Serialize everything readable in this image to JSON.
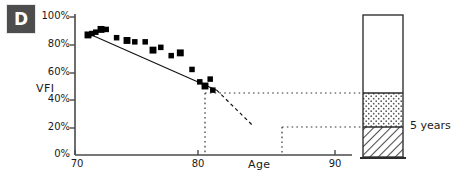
{
  "panel": {
    "label": "D"
  },
  "axes": {
    "y_title": "VFI",
    "x_title": "Age",
    "y_ticks": [
      "0%",
      "20%",
      "40%",
      "60%",
      "80%",
      "100%"
    ],
    "x_ticks": [
      "70",
      "80",
      "90"
    ]
  },
  "annotation": {
    "bar_label": "5 years"
  },
  "colors": {
    "panel_tag_bg": "#4d4d4d",
    "panel_tag_text": "#ffffff",
    "axis": "#4a4a4a",
    "point": "#000000",
    "trend": "#000000",
    "dotted": "#333333",
    "bar_outline": "#333333",
    "bar_top_fill": "#ffffff",
    "bar_mid_fill": "#f2f2f2",
    "bar_bottom_fill": "#e0e0e0"
  },
  "chart_data": {
    "type": "scatter",
    "title": "",
    "xlabel": "Age",
    "ylabel": "VFI",
    "xlim": [
      70,
      90
    ],
    "ylim": [
      0,
      100
    ],
    "grid": false,
    "legend": null,
    "series": [
      {
        "name": "VFI measurements",
        "marker": "filled-square",
        "x": [
          71.0,
          71.3,
          71.6,
          72.0,
          72.4,
          73.2,
          74.0,
          74.6,
          75.4,
          76.0,
          76.6,
          77.4,
          78.1,
          79.0,
          79.6,
          80.0,
          80.4,
          80.6
        ],
        "y": [
          87,
          88,
          89,
          91,
          91,
          85,
          83,
          82,
          82,
          76,
          78,
          72,
          74,
          62,
          53,
          50,
          55,
          47
        ]
      }
    ],
    "trend_line": {
      "name": "regression fit",
      "style": "solid",
      "x": [
        70.8,
        80.9
      ],
      "y": [
        89,
        47
      ]
    },
    "extrapolation_line": {
      "name": "5-year projection",
      "style": "dashed",
      "x": [
        80.9,
        83.6
      ],
      "y": [
        47,
        22
      ]
    },
    "reference_lines": [
      {
        "name": "current-vfi",
        "orientation": "horizontal",
        "y": 47,
        "x_from": 80.9,
        "x_to": 90.0,
        "style": "dotted"
      },
      {
        "name": "projected-vfi",
        "orientation": "horizontal",
        "y": 22,
        "x_from": 83.6,
        "x_to": 90.0,
        "style": "dotted"
      },
      {
        "name": "current-age",
        "orientation": "vertical",
        "x": 80.9,
        "y_from": 0,
        "y_to": 47,
        "style": "dotted"
      },
      {
        "name": "projected-age",
        "orientation": "vertical",
        "x": 83.6,
        "y_from": 0,
        "y_to": 22,
        "style": "dotted"
      }
    ],
    "reserve_bar": {
      "name": "visual-field-reserve-bar",
      "segments": [
        {
          "name": "remaining-reserve",
          "from": 47,
          "to": 100,
          "fill": "blank"
        },
        {
          "name": "five-year-loss",
          "from": 22,
          "to": 47,
          "fill": "stipple"
        },
        {
          "name": "residual-after-5-years",
          "from": 0,
          "to": 22,
          "fill": "hatch"
        }
      ],
      "label": "5 years"
    }
  }
}
